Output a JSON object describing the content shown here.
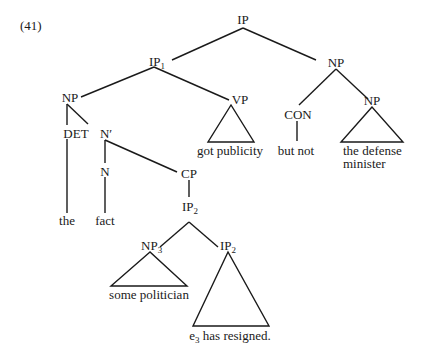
{
  "example_number": "(41)",
  "nodes": {
    "ip_root": {
      "label": "IP",
      "sub": ""
    },
    "ip1": {
      "label": "IP",
      "sub": "1"
    },
    "np_right": {
      "label": "NP",
      "sub": ""
    },
    "np_subject": {
      "label": "NP",
      "sub": ""
    },
    "vp": {
      "label": "VP",
      "sub": ""
    },
    "con": {
      "label": "CON",
      "sub": ""
    },
    "np_minister": {
      "label": "NP",
      "sub": ""
    },
    "det": {
      "label": "DET",
      "sub": ""
    },
    "nbar": {
      "label": "N′",
      "sub": ""
    },
    "n": {
      "label": "N",
      "sub": ""
    },
    "cp": {
      "label": "CP",
      "sub": ""
    },
    "ip2_upper": {
      "label": "IP",
      "sub": "2"
    },
    "np3": {
      "label": "NP",
      "sub": "3"
    },
    "ip2_lower": {
      "label": "IP",
      "sub": "2"
    }
  },
  "leaves": {
    "the": "the",
    "fact": "fact",
    "got_publicity": "got publicity",
    "but_not": "but not",
    "defense_line1": "the defense",
    "defense_line2": "minister",
    "some_politician": "some politician",
    "resigned_e": "e",
    "resigned_sub": "3",
    "resigned_rest": " has resigned."
  }
}
